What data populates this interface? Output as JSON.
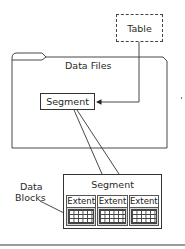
{
  "diagram": {
    "table": {
      "label": "Table"
    },
    "data_files": {
      "label": "Data Files"
    },
    "segment_small": {
      "label": "Segment"
    },
    "segment_detail": {
      "label": "Segment",
      "extents": [
        {
          "label": "Extent"
        },
        {
          "label": "Extent"
        },
        {
          "label": "Extent"
        }
      ]
    },
    "data_blocks": {
      "label_line1": "Data",
      "label_line2": "Blocks"
    },
    "colors": {
      "stroke": "#333333",
      "fill": "#ffffff",
      "extent_gap": "#d8d8d8"
    }
  }
}
